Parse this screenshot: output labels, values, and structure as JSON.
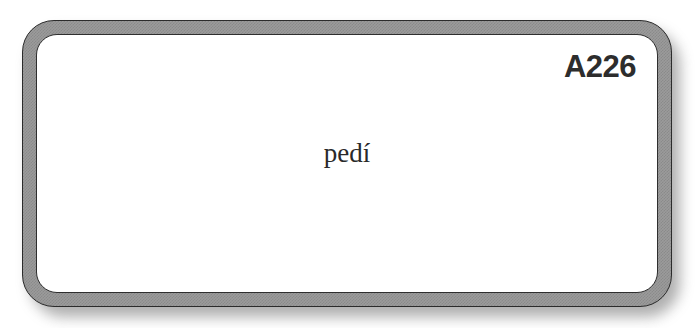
{
  "card": {
    "code": "A226",
    "word": "pedí",
    "background_color": "#ffffff",
    "frame_band_color": "#9b9b9b",
    "frame_outline_color": "#2b2b2b",
    "face_color": "#ffffff",
    "code_color": "#2d2d2d",
    "word_color": "#2a2a2a",
    "shadow_color": "#6d6d6d"
  }
}
